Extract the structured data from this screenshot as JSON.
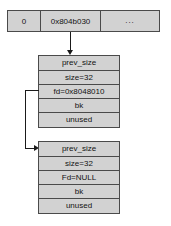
{
  "diagram": {
    "colors": {
      "cell_fill": "#d2d2d2",
      "cell_border": "#4a4a4a",
      "arrow": "#1a1a1a",
      "text": "#121212",
      "background": "#ffffff"
    }
  },
  "pointer_table": {
    "cells": [
      {
        "label": "0"
      },
      {
        "label": "0x804b030"
      },
      {
        "label": "..."
      }
    ]
  },
  "chunks": [
    {
      "name": "chunk-1",
      "rows": [
        {
          "label": "prev_size"
        },
        {
          "label": "size=32"
        },
        {
          "label": "fd=0x8048010"
        },
        {
          "label": "bk"
        },
        {
          "label": "unused"
        }
      ]
    },
    {
      "name": "chunk-2",
      "rows": [
        {
          "label": "prev_size"
        },
        {
          "label": "size=32"
        },
        {
          "label": "Fd=NULL"
        },
        {
          "label": "bk"
        },
        {
          "label": "unused"
        }
      ]
    }
  ],
  "connectors": [
    {
      "name": "table-to-chunk1",
      "from": "pointer_table.cells.1",
      "to": "chunks.0.rows.0"
    },
    {
      "name": "chunk1-fd-to-chunk2",
      "from": "chunks.0.rows.2",
      "to": "chunks.1.rows.0"
    }
  ]
}
